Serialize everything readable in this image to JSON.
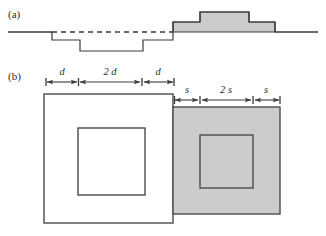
{
  "figure": {
    "panels": [
      {
        "label": "(a)",
        "label_x": 8,
        "label_y": 18,
        "description": "step height profile cross-section with depressed region left of center and raised shaded region right of center, dashed reference line at baseline level"
      },
      {
        "label": "(b)",
        "label_x": 8,
        "label_y": 80,
        "description": "plan view of two overlapping squares with nested inner squares, left square unfilled, right square shaded, annotated with dimension arrows"
      }
    ],
    "panel_a": {
      "baseline_y": 32,
      "baseline_x_start": 8,
      "baseline_x_end": 318,
      "dashed_x_start": 52,
      "dashed_x_end": 173,
      "profile_points": "8,32 52,32 52,40 80,40 80,51 143,51 143,40 173,40 173,22 200,22 200,12 249,12 249,22 275,22 275,32 318,32",
      "shaded_region_points": "173,32 173,22 200,22 200,12 249,12 249,22 275,22 275,32",
      "levels": {
        "baseline": 32,
        "step_down_1": 40,
        "step_down_2": 51,
        "step_up_1": 22,
        "step_up_2": 12
      }
    },
    "panel_b": {
      "white_square": {
        "x": 44,
        "y": 94,
        "size": 129
      },
      "white_inner_square": {
        "x": 78,
        "y": 128,
        "size": 67
      },
      "gray_square": {
        "x": 173,
        "y": 107,
        "size": 107
      },
      "gray_inner_square": {
        "x": 200,
        "y": 135,
        "size": 53
      },
      "dimension_rows": [
        {
          "name": "d-row",
          "y_line": 82,
          "y_text": 75,
          "segments": [
            {
              "label": "d",
              "x_start": 46,
              "x_end": 78
            },
            {
              "label": "2 d",
              "x_start": 78,
              "x_end": 142
            },
            {
              "label": "d",
              "x_start": 142,
              "x_end": 174
            }
          ]
        },
        {
          "name": "s-row",
          "y_line": 100,
          "y_text": 93,
          "segments": [
            {
              "label": "s",
              "x_start": 174,
              "x_end": 200
            },
            {
              "label": "2 s",
              "x_start": 200,
              "x_end": 253
            },
            {
              "label": "s",
              "x_start": 253,
              "x_end": 280
            }
          ]
        }
      ]
    },
    "colors": {
      "shade_fill": "#cccccc",
      "stroke": "#3a3a3a",
      "square_stroke": "#4a4a4a",
      "background": "#ffffff"
    }
  }
}
